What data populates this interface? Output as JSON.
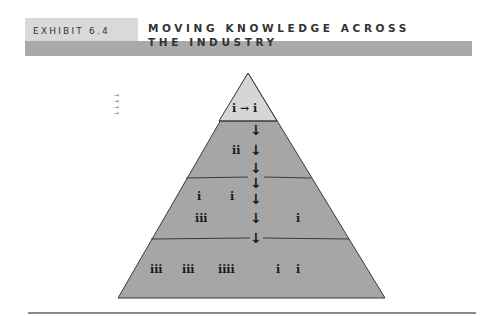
{
  "header": {
    "exhibit_label": "EXHIBIT 6.4",
    "title_line1": "MOVING KNOWLEDGE ACROSS",
    "title_line2": "THE INDUSTRY"
  },
  "legend_arrows": [
    "→",
    "→",
    "→",
    "→"
  ],
  "pyramid": {
    "levels": [
      {
        "name": "top",
        "fill": "#d6d6d6",
        "labels": [
          {
            "text": "i → i"
          }
        ]
      },
      {
        "name": "level-2",
        "fill": "#a6a6a6",
        "labels": [
          {
            "text": "ii"
          }
        ]
      },
      {
        "name": "level-3",
        "fill": "#a6a6a6",
        "labels": [
          {
            "text": "i"
          },
          {
            "text": "i"
          },
          {
            "text": "iii"
          },
          {
            "text": "i"
          }
        ]
      },
      {
        "name": "base",
        "fill": "#a6a6a6",
        "labels": [
          {
            "text": "iii"
          },
          {
            "text": "iii"
          },
          {
            "text": "iiii"
          },
          {
            "text": "i"
          },
          {
            "text": "i"
          }
        ]
      }
    ],
    "down_arrow": "↓",
    "colors": {
      "top_fill": "#d6d6d6",
      "band_fill": "#a6a6a6",
      "stroke": "#3a3a3a"
    }
  }
}
